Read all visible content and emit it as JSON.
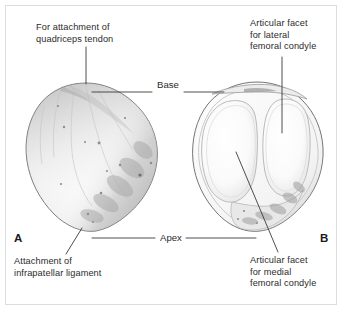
{
  "figure": {
    "background_color": "#ffffff",
    "frame_color": "#dcdcdc",
    "text_color": "#2b2b2b",
    "leader_line_color": "#3a3a3a",
    "bone_outline_color": "#5a5a5a",
    "bone_fill_color": "#fbfbfb",
    "shading_color": "#b9b9b9"
  },
  "panels": {
    "left": {
      "marker": "A",
      "view": "anterior"
    },
    "right": {
      "marker": "B",
      "view": "posterior"
    }
  },
  "labels": {
    "quadriceps": {
      "line1": "For attachment of",
      "line2": "quadriceps tendon"
    },
    "lateral_facet": {
      "line1": "Articular facet",
      "line2": "for lateral",
      "line3": "femoral condyle"
    },
    "infrapatellar": {
      "line1": "Attachment of",
      "line2": "infrapatellar ligament"
    },
    "medial_facet": {
      "line1": "Articular facet",
      "line2": "for medial",
      "line3": "femoral condyle"
    },
    "base": "Base",
    "apex": "Apex"
  }
}
